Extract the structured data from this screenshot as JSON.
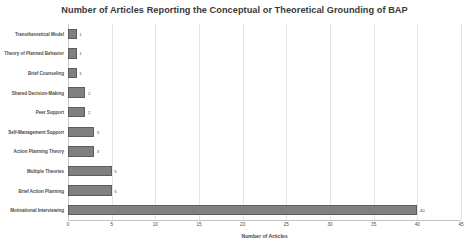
{
  "chart_data": {
    "type": "bar",
    "orientation": "horizontal",
    "title": "Number of Articles Reporting the Conceptual or Theoretical Grounding of BAP",
    "xlabel": "Number of Articles",
    "ylabel": "",
    "categories": [
      "Transtheoretical Model",
      "Theory of Planned Behavior",
      "Brief Counseling",
      "Shared Decision-Making",
      "Peer Support",
      "Self-Management Support",
      "Action Planning Theory",
      "Multiple Theories",
      "Brief Action Planning",
      "Motivational Interviewing"
    ],
    "values": [
      1,
      1,
      1,
      2,
      2,
      3,
      3,
      5,
      5,
      40
    ],
    "data_labels": [
      "1",
      "1",
      "1",
      "2",
      "2",
      "3",
      "3",
      "5",
      "5",
      "40"
    ],
    "xlim": [
      0,
      45
    ],
    "xticks": [
      0,
      5,
      10,
      15,
      20,
      25,
      30,
      35,
      40,
      45
    ],
    "xtick_labels": [
      "0",
      "5",
      "10",
      "15",
      "20",
      "25",
      "30",
      "35",
      "40",
      "45"
    ],
    "grid": "vertical",
    "legend": null,
    "bar_color": "#808080",
    "bar_border_color": "#5d5d5d",
    "gridline_color": "#e4e4e4",
    "text_color": "#4a4a4a",
    "title_color": "#3a3a3a",
    "background_color": "#ffffff"
  }
}
